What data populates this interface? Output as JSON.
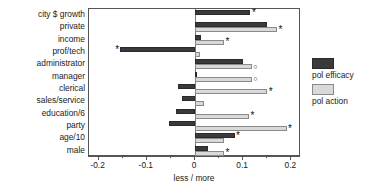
{
  "chart_data": {
    "type": "bar",
    "orientation": "horizontal",
    "title": "",
    "xlabel": "less / more",
    "ylabel": "",
    "xlim": [
      -0.22,
      0.22
    ],
    "xticks": [
      -0.2,
      -0.1,
      0,
      0.1,
      0.2
    ],
    "xticklabels": [
      "-0.2",
      "-0.1",
      "0",
      "0.1",
      "0.2"
    ],
    "grid": false,
    "zero_reference_line": 0,
    "legend_position": "right",
    "categories": [
      "city $ growth",
      "private",
      "income",
      "prof/tech",
      "administrator",
      "manager",
      "clerical",
      "sales/service",
      "education/6",
      "party",
      "age/10",
      "male"
    ],
    "series": [
      {
        "name": "pol efficacy",
        "color": "#3a3a3a",
        "values": [
          0.115,
          0.15,
          0.012,
          -0.155,
          0.1,
          0.004,
          -0.035,
          -0.028,
          -0.04,
          -0.055,
          0.082,
          0.027
        ]
      },
      {
        "name": "pol action",
        "color": "#d9d9d9",
        "values": [
          0.0,
          0.17,
          0.06,
          0.01,
          0.118,
          0.118,
          0.15,
          0.018,
          0.112,
          0.19,
          0.06,
          0.06
        ]
      }
    ],
    "annotations": [
      {
        "category": "city $ growth",
        "series": "pol efficacy",
        "marker": "*"
      },
      {
        "category": "private",
        "series": "pol action",
        "marker": "*"
      },
      {
        "category": "income",
        "series": "pol action",
        "marker": "*"
      },
      {
        "category": "prof/tech",
        "series": "pol efficacy",
        "marker": "*"
      },
      {
        "category": "administrator",
        "series": "pol action",
        "marker": "o"
      },
      {
        "category": "manager",
        "series": "pol action",
        "marker": "o"
      },
      {
        "category": "clerical",
        "series": "pol action",
        "marker": "*"
      },
      {
        "category": "education/6",
        "series": "pol action",
        "marker": "*"
      },
      {
        "category": "party",
        "series": "pol action",
        "marker": "*"
      },
      {
        "category": "age/10",
        "series": "pol efficacy",
        "marker": "*"
      },
      {
        "category": "male",
        "series": "pol action",
        "marker": "*"
      }
    ]
  },
  "legend": {
    "entries": [
      {
        "label": "pol efficacy",
        "swatch": "dark"
      },
      {
        "label": "pol action",
        "swatch": "light"
      }
    ]
  }
}
